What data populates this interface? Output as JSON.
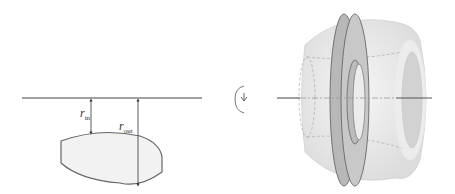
{
  "diagram": {
    "cross_section": {
      "axis_label": "axis of revolution",
      "shape": "lens-shaped cross section (flat ends, curved top and bottom)",
      "r_in": {
        "symbol": "r",
        "subscript": "in"
      },
      "r_out": {
        "symbol": "r",
        "subscript": "out"
      }
    },
    "rotation_symbol": {
      "name": "rotation-arrow",
      "glyph": "↻"
    },
    "solid": {
      "description": "solid of revolution with inner hole, cut disk (washer) shown",
      "washer_highlight": "#9a9a9a"
    },
    "colors": {
      "line": "#444444",
      "shape_fill": "#f2f2f2",
      "solid_fill": "#e6e6e6",
      "washer_fill": "#b5b5b5",
      "hole_fill": "#cfcfcf"
    }
  }
}
